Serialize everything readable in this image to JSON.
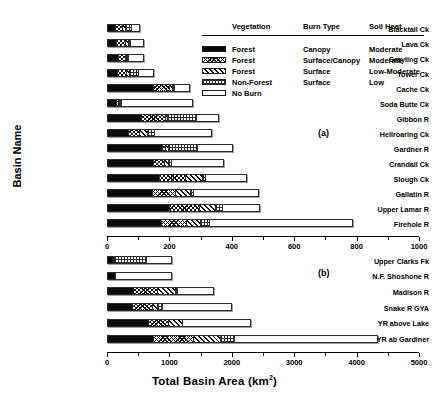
{
  "chart_data": {
    "type": "bar",
    "orientation": "horizontal",
    "stacked": true,
    "title": "",
    "xlabel": "Total Basin Area (km2)",
    "xlabel_unit_superscript": "2",
    "ylabel": "Basin Name",
    "grid": false,
    "legend_position": "upper-right-inside",
    "series": [
      {
        "name": "Forest / Canopy / Moderate",
        "key": "forest_canopy"
      },
      {
        "name": "Forest / Surface-Canopy / Moderate",
        "key": "forest_surface_canopy"
      },
      {
        "name": "Forest / Surface / Low-Moderate",
        "key": "forest_surface"
      },
      {
        "name": "Non-Forest / Surface / Low",
        "key": "nonforest_surface"
      },
      {
        "name": "No Burn",
        "key": "no_burn"
      }
    ],
    "panels": [
      {
        "tag": "(a)",
        "xlim": [
          0,
          1000
        ],
        "xticks": [
          0,
          200,
          400,
          600,
          800,
          1000
        ],
        "xtick_labels": [
          "0",
          "200",
          "400",
          "600",
          "800",
          "1000"
        ],
        "xminor_step": 100,
        "categories": [
          "Blacktail Ck",
          "Lava Ck",
          "Grayling Ck",
          "Tower Ck",
          "Cache Ck",
          "Soda Butte Ck",
          "Gibbon  R",
          "Hellroaring Ck",
          "Gardner R",
          "Crandall Ck",
          "Slough Ck",
          "Gallatin R",
          "Upper Lamar R",
          "Firehole  R"
        ],
        "values": [
          [
            28,
            22,
            10,
            22,
            25
          ],
          [
            32,
            28,
            10,
            8,
            42
          ],
          [
            38,
            22,
            6,
            4,
            50
          ],
          [
            35,
            30,
            8,
            32,
            45
          ],
          [
            150,
            55,
            10,
            5,
            45
          ],
          [
            28,
            8,
            5,
            4,
            230
          ],
          [
            110,
            80,
            5,
            95,
            70
          ],
          [
            70,
            35,
            25,
            25,
            180
          ],
          [
            180,
            10,
            8,
            95,
            110
          ],
          [
            150,
            35,
            15,
            10,
            165
          ],
          [
            170,
            85,
            55,
            10,
            130
          ],
          [
            145,
            75,
            50,
            8,
            210
          ],
          [
            200,
            100,
            50,
            25,
            115
          ],
          [
            175,
            80,
            45,
            30,
            460
          ]
        ]
      },
      {
        "tag": "(b)",
        "xlim": [
          0,
          5000
        ],
        "xticks": [
          0,
          1000,
          2000,
          3000,
          4000,
          5000
        ],
        "xtick_labels": [
          "0",
          "1000",
          "2000",
          "3000",
          "4000",
          "5000"
        ],
        "xminor_step": 500,
        "categories": [
          "Upper Clarks Fk",
          "N.F. Shoshone R",
          "Madison R",
          "Snake R GYA",
          "YR above Lake",
          "YR ab Gardiner"
        ],
        "values": [
          [
            120,
            0,
            0,
            520,
            400
          ],
          [
            135,
            0,
            0,
            0,
            900
          ],
          [
            430,
            380,
            300,
            40,
            560
          ],
          [
            400,
            330,
            90,
            70,
            1120
          ],
          [
            660,
            330,
            230,
            0,
            1080
          ],
          [
            740,
            650,
            430,
            230,
            2300
          ]
        ]
      }
    ]
  },
  "legend": {
    "headers": [
      "Vegetation",
      "Burn Type",
      "Soil Heat"
    ],
    "rows": [
      {
        "pattern": "solid-black",
        "vegetation": "Forest",
        "burn_type": "Canopy",
        "soil_heat": "Moderate"
      },
      {
        "pattern": "cross-hatch-fine",
        "vegetation": "Forest",
        "burn_type": "Surface/Canopy",
        "soil_heat": "Moderate"
      },
      {
        "pattern": "diagonal-hatch",
        "vegetation": "Forest",
        "burn_type": "Surface",
        "soil_heat": "Low-Moderate"
      },
      {
        "pattern": "dotted-grid",
        "vegetation": "Non-Forest",
        "burn_type": "Surface",
        "soil_heat": "Low"
      },
      {
        "pattern": "empty-white",
        "vegetation": "No Burn",
        "burn_type": "",
        "soil_heat": ""
      }
    ]
  },
  "axes": {
    "x_title_text": "Total Basin Area (km",
    "x_title_sup": "2",
    "x_title_tail": ")",
    "y_title": "Basin Name"
  },
  "colors": {
    "ink": "#000000",
    "bar_edge": "#2b2b2b",
    "background": "#ffffff"
  }
}
